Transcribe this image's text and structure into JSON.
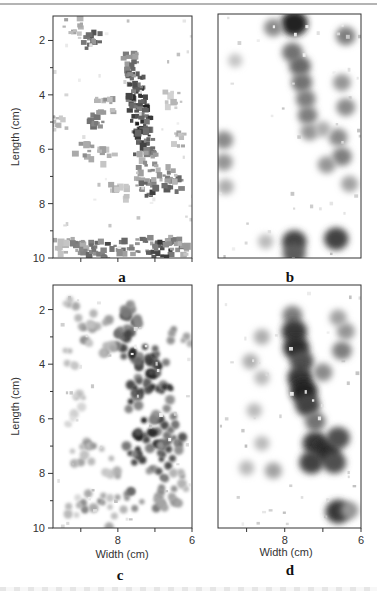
{
  "figure": {
    "panel_labels": [
      "a",
      "b",
      "c",
      "d"
    ]
  },
  "chart_data": [
    {
      "type": "heatmap",
      "panel": "a",
      "title": "a",
      "xlabel": "",
      "ylabel": "Length (cm)",
      "ylim": [
        1.1,
        10
      ],
      "xlim": [
        9.75,
        6
      ],
      "yticks": [
        2,
        4,
        6,
        8,
        10
      ],
      "yticklabels": [
        "2",
        "4",
        "6",
        "8",
        "10"
      ],
      "xticks": [
        9,
        8,
        7,
        6
      ],
      "xticklabels": [],
      "style": "pixelated",
      "description": "Dark vertical streak around width 7.6 cm from length 2.5 to 6 cm, bending to 7.2 cm near length 7.5 cm; dense dark band at length 9.5–9.9 cm",
      "blobs": [
        {
          "x": 7.65,
          "y": 2.7,
          "s": 0.55
        },
        {
          "x": 7.62,
          "y": 3.1,
          "s": 0.7
        },
        {
          "x": 7.55,
          "y": 3.5,
          "s": 0.8
        },
        {
          "x": 7.5,
          "y": 3.9,
          "s": 0.85
        },
        {
          "x": 7.45,
          "y": 4.3,
          "s": 0.8
        },
        {
          "x": 7.4,
          "y": 4.7,
          "s": 0.9
        },
        {
          "x": 7.35,
          "y": 5.1,
          "s": 0.9
        },
        {
          "x": 7.3,
          "y": 5.5,
          "s": 0.85
        },
        {
          "x": 7.3,
          "y": 5.9,
          "s": 0.75
        },
        {
          "x": 7.2,
          "y": 6.4,
          "s": 0.5
        },
        {
          "x": 7.25,
          "y": 7.1,
          "s": 0.55
        },
        {
          "x": 7.15,
          "y": 7.5,
          "s": 0.8
        },
        {
          "x": 6.5,
          "y": 7.3,
          "s": 0.7
        },
        {
          "x": 6.7,
          "y": 6.9,
          "s": 0.5
        },
        {
          "x": 8.7,
          "y": 2.0,
          "s": 0.7
        },
        {
          "x": 9.2,
          "y": 1.5,
          "s": 0.4
        },
        {
          "x": 8.55,
          "y": 4.9,
          "s": 0.6
        },
        {
          "x": 8.35,
          "y": 4.4,
          "s": 0.45
        },
        {
          "x": 8.9,
          "y": 6.1,
          "s": 0.5
        },
        {
          "x": 8.25,
          "y": 6.3,
          "s": 0.4
        },
        {
          "x": 8.0,
          "y": 7.6,
          "s": 0.35
        },
        {
          "x": 9.5,
          "y": 9.6,
          "s": 0.4
        },
        {
          "x": 9.1,
          "y": 9.6,
          "s": 0.55
        },
        {
          "x": 8.7,
          "y": 9.7,
          "s": 0.6
        },
        {
          "x": 8.2,
          "y": 9.8,
          "s": 0.75
        },
        {
          "x": 7.7,
          "y": 9.6,
          "s": 0.6
        },
        {
          "x": 7.2,
          "y": 9.55,
          "s": 0.65
        },
        {
          "x": 6.8,
          "y": 9.7,
          "s": 0.9
        },
        {
          "x": 6.5,
          "y": 9.5,
          "s": 0.55
        },
        {
          "x": 6.3,
          "y": 9.7,
          "s": 0.4
        },
        {
          "x": 6.4,
          "y": 5.6,
          "s": 0.35
        },
        {
          "x": 6.6,
          "y": 4.2,
          "s": 0.3
        },
        {
          "x": 9.55,
          "y": 5.0,
          "s": 0.35
        }
      ]
    },
    {
      "type": "heatmap",
      "panel": "b",
      "title": "b",
      "xlabel": "",
      "ylabel": "",
      "ylim": [
        1.1,
        10
      ],
      "xlim": [
        9.75,
        6
      ],
      "yticks": [],
      "xticks": [],
      "style": "smooth",
      "description": "Dark spot at top around width 7.7, length 1.5; broad grey column width 7.4–7.9 from length 2 to 6; darker right edge column width 6.2–6.8; two dark spots at bottom near width 7.7 and 6.6, length 9.2–9.9",
      "blobs": [
        {
          "x": 7.75,
          "y": 1.45,
          "s": 0.95
        },
        {
          "x": 8.3,
          "y": 1.6,
          "s": 0.5
        },
        {
          "x": 6.4,
          "y": 1.9,
          "s": 0.55
        },
        {
          "x": 7.8,
          "y": 2.5,
          "s": 0.6
        },
        {
          "x": 7.6,
          "y": 3.0,
          "s": 0.65
        },
        {
          "x": 7.55,
          "y": 3.6,
          "s": 0.6
        },
        {
          "x": 7.45,
          "y": 4.2,
          "s": 0.55
        },
        {
          "x": 7.4,
          "y": 4.8,
          "s": 0.55
        },
        {
          "x": 7.35,
          "y": 5.4,
          "s": 0.45
        },
        {
          "x": 6.5,
          "y": 3.6,
          "s": 0.45
        },
        {
          "x": 6.4,
          "y": 4.5,
          "s": 0.5
        },
        {
          "x": 6.6,
          "y": 5.6,
          "s": 0.5
        },
        {
          "x": 6.5,
          "y": 6.3,
          "s": 0.55
        },
        {
          "x": 6.9,
          "y": 6.6,
          "s": 0.45
        },
        {
          "x": 7.0,
          "y": 5.3,
          "s": 0.35
        },
        {
          "x": 6.3,
          "y": 7.3,
          "s": 0.4
        },
        {
          "x": 9.6,
          "y": 5.7,
          "s": 0.5
        },
        {
          "x": 9.6,
          "y": 6.5,
          "s": 0.45
        },
        {
          "x": 9.55,
          "y": 7.4,
          "s": 0.35
        },
        {
          "x": 7.75,
          "y": 9.4,
          "s": 0.8
        },
        {
          "x": 7.75,
          "y": 9.85,
          "s": 0.7
        },
        {
          "x": 6.65,
          "y": 9.3,
          "s": 0.8
        },
        {
          "x": 8.5,
          "y": 9.4,
          "s": 0.3
        },
        {
          "x": 9.3,
          "y": 2.8,
          "s": 0.25
        }
      ]
    },
    {
      "type": "heatmap",
      "panel": "c",
      "title": "c",
      "xlabel": "Width (cm)",
      "ylabel": "Length (cm)",
      "ylim": [
        1.1,
        10
      ],
      "xlim": [
        9.75,
        6
      ],
      "yticks": [
        2,
        4,
        6,
        8,
        10
      ],
      "yticklabels": [
        "2",
        "4",
        "6",
        "8",
        "10"
      ],
      "xticks": [
        9,
        8,
        7,
        6
      ],
      "xticklabels": [
        "",
        "8",
        "",
        "6"
      ],
      "style": "dotted",
      "description": "Dense dark dot cluster spanning width 6.4–8.0, length 2–8; scattered light dots elsewhere; band of dots at length 9",
      "blobs": [
        {
          "x": 7.9,
          "y": 2.0,
          "s": 0.7
        },
        {
          "x": 7.7,
          "y": 2.6,
          "s": 0.8
        },
        {
          "x": 7.8,
          "y": 3.2,
          "s": 0.9
        },
        {
          "x": 7.6,
          "y": 3.8,
          "s": 0.9
        },
        {
          "x": 7.2,
          "y": 3.6,
          "s": 0.8
        },
        {
          "x": 6.9,
          "y": 4.2,
          "s": 0.9
        },
        {
          "x": 7.4,
          "y": 4.6,
          "s": 0.85
        },
        {
          "x": 7.6,
          "y": 5.3,
          "s": 0.9
        },
        {
          "x": 6.8,
          "y": 5.0,
          "s": 0.85
        },
        {
          "x": 6.7,
          "y": 5.9,
          "s": 0.8
        },
        {
          "x": 7.3,
          "y": 6.3,
          "s": 0.9
        },
        {
          "x": 7.0,
          "y": 6.8,
          "s": 0.85
        },
        {
          "x": 7.5,
          "y": 7.3,
          "s": 0.9
        },
        {
          "x": 6.6,
          "y": 7.3,
          "s": 0.85
        },
        {
          "x": 6.9,
          "y": 7.9,
          "s": 0.7
        },
        {
          "x": 6.5,
          "y": 6.5,
          "s": 0.7
        },
        {
          "x": 8.5,
          "y": 2.4,
          "s": 0.55
        },
        {
          "x": 8.8,
          "y": 2.9,
          "s": 0.45
        },
        {
          "x": 8.3,
          "y": 3.4,
          "s": 0.4
        },
        {
          "x": 9.3,
          "y": 2.0,
          "s": 0.35
        },
        {
          "x": 9.4,
          "y": 3.8,
          "s": 0.3
        },
        {
          "x": 8.9,
          "y": 4.9,
          "s": 0.3
        },
        {
          "x": 9.2,
          "y": 5.9,
          "s": 0.25
        },
        {
          "x": 8.6,
          "y": 7.2,
          "s": 0.45
        },
        {
          "x": 9.0,
          "y": 7.3,
          "s": 0.4
        },
        {
          "x": 8.2,
          "y": 7.8,
          "s": 0.35
        },
        {
          "x": 8.7,
          "y": 9.0,
          "s": 0.5
        },
        {
          "x": 8.2,
          "y": 9.0,
          "s": 0.4
        },
        {
          "x": 7.6,
          "y": 9.0,
          "s": 0.6
        },
        {
          "x": 6.9,
          "y": 9.0,
          "s": 0.55
        },
        {
          "x": 6.6,
          "y": 8.8,
          "s": 0.6
        },
        {
          "x": 9.2,
          "y": 9.2,
          "s": 0.3
        },
        {
          "x": 8.0,
          "y": 9.9,
          "s": 0.35
        },
        {
          "x": 6.3,
          "y": 3.0,
          "s": 0.45
        },
        {
          "x": 6.4,
          "y": 8.3,
          "s": 0.45
        }
      ]
    },
    {
      "type": "heatmap",
      "panel": "d",
      "title": "d",
      "xlabel": "Width (cm)",
      "ylabel": "",
      "ylim": [
        1.1,
        10
      ],
      "xlim": [
        9.75,
        6
      ],
      "yticks": [],
      "xticks": [
        9,
        8,
        7,
        6
      ],
      "xticklabels": [
        "",
        "8",
        "",
        "6"
      ],
      "style": "smooth",
      "description": "Dark column near width 7.7 from length 2.5 to 5.5, widening to 6.5–7.4 near length 7; diffuse grey spots to the left; dark spot at width 6.6, length 9.4",
      "blobs": [
        {
          "x": 7.8,
          "y": 2.2,
          "s": 0.55
        },
        {
          "x": 7.75,
          "y": 2.8,
          "s": 0.85
        },
        {
          "x": 7.7,
          "y": 3.4,
          "s": 0.9
        },
        {
          "x": 7.55,
          "y": 3.9,
          "s": 0.75
        },
        {
          "x": 7.6,
          "y": 4.5,
          "s": 0.85
        },
        {
          "x": 7.5,
          "y": 5.0,
          "s": 0.95
        },
        {
          "x": 7.4,
          "y": 5.5,
          "s": 0.8
        },
        {
          "x": 7.2,
          "y": 6.1,
          "s": 0.6
        },
        {
          "x": 7.2,
          "y": 6.9,
          "s": 0.85
        },
        {
          "x": 6.9,
          "y": 7.2,
          "s": 0.9
        },
        {
          "x": 6.6,
          "y": 6.7,
          "s": 0.75
        },
        {
          "x": 7.3,
          "y": 7.6,
          "s": 0.8
        },
        {
          "x": 6.7,
          "y": 7.6,
          "s": 0.75
        },
        {
          "x": 7.0,
          "y": 4.3,
          "s": 0.5
        },
        {
          "x": 6.5,
          "y": 3.5,
          "s": 0.55
        },
        {
          "x": 6.4,
          "y": 2.8,
          "s": 0.45
        },
        {
          "x": 6.6,
          "y": 2.3,
          "s": 0.4
        },
        {
          "x": 8.6,
          "y": 3.0,
          "s": 0.35
        },
        {
          "x": 8.9,
          "y": 3.9,
          "s": 0.35
        },
        {
          "x": 8.6,
          "y": 4.5,
          "s": 0.3
        },
        {
          "x": 8.8,
          "y": 5.7,
          "s": 0.3
        },
        {
          "x": 9.0,
          "y": 7.8,
          "s": 0.3
        },
        {
          "x": 8.3,
          "y": 7.9,
          "s": 0.4
        },
        {
          "x": 8.6,
          "y": 6.9,
          "s": 0.3
        },
        {
          "x": 6.6,
          "y": 9.4,
          "s": 0.85
        },
        {
          "x": 6.3,
          "y": 9.35,
          "s": 0.45
        }
      ]
    }
  ]
}
